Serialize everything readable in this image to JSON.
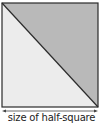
{
  "diagram": {
    "caption": "size of half-square",
    "shape": "square split diagonally into two triangles",
    "colors": {
      "upper_triangle": "#b9b9b9",
      "lower_triangle": "#ececec",
      "outline": "#2b2b2b",
      "arrow": "#444444"
    },
    "arrow": "double-headed horizontal dimension arrow"
  }
}
